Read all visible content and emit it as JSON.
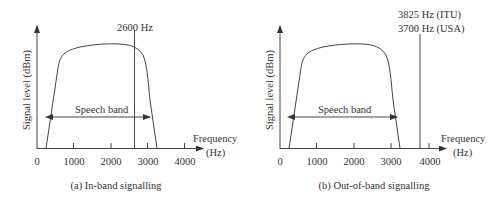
{
  "panels": [
    {
      "caption": "(a) In-band signalling",
      "y_axis_label": "Signal level (dBm)",
      "x_axis_label_line1": "Frequency",
      "x_axis_label_line2": "(Hz)",
      "x_ticks": [
        "0",
        "1000",
        "2000",
        "3000",
        "4000"
      ],
      "band_label": "Speech band",
      "marker_label_line1": "2600 Hz",
      "marker_label_line2": ""
    },
    {
      "caption": "(b) Out-of-band signalling",
      "y_axis_label": "Signal level (dBm)",
      "x_axis_label_line1": "Frequency",
      "x_axis_label_line2": "(Hz)",
      "x_ticks": [
        "0",
        "1000",
        "2000",
        "3000",
        "4000"
      ],
      "band_label": "Speech band",
      "marker_label_line1": "3825 Hz (ITU)",
      "marker_label_line2": "3700 Hz (USA)"
    }
  ]
}
